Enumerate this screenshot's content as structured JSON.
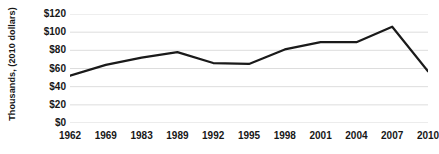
{
  "chart_data": {
    "type": "line",
    "title": "",
    "xlabel": "",
    "ylabel": "Thousands, (2010 dollars)",
    "categories": [
      "1962",
      "1969",
      "1983",
      "1989",
      "1992",
      "1995",
      "1998",
      "2001",
      "2004",
      "2007",
      "2010"
    ],
    "values": [
      52,
      64,
      72,
      78,
      66,
      65,
      81,
      89,
      89,
      106,
      57
    ],
    "ylim": [
      0,
      120
    ],
    "ytick_values": [
      0,
      20,
      40,
      60,
      80,
      100,
      120
    ],
    "ytick_labels": [
      "$0",
      "$20",
      "$40",
      "$60",
      "$80",
      "$100",
      "$120"
    ],
    "grid": true,
    "legend": false,
    "line_color": "#1a1a1a",
    "grid_color": "#d9d9d9",
    "background_color": "#ffffff"
  }
}
